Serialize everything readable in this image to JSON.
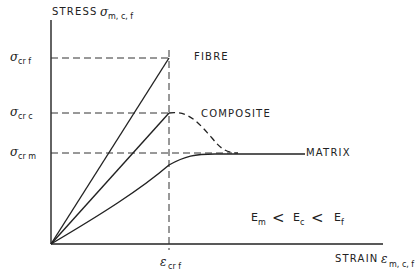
{
  "diagram": {
    "y_axis_label": "STRESS",
    "y_axis_symbol": "σ",
    "y_axis_subscript": "m, c, f",
    "x_axis_label": "STRAIN",
    "x_axis_symbol": "ε",
    "x_axis_subscript": "m, c, f",
    "y_ticks": [
      {
        "symbol": "σ",
        "subscript": "cr f"
      },
      {
        "symbol": "σ",
        "subscript": "cr c"
      },
      {
        "symbol": "σ",
        "subscript": "cr m"
      }
    ],
    "x_tick": {
      "symbol": "ε",
      "subscript": "cr f"
    },
    "curves": [
      {
        "name": "FIBRE",
        "style": "solid",
        "shape": "linear to failure"
      },
      {
        "name": "COMPOSITE",
        "style": "solid then dashed",
        "shape": "linear then peak then decline to matrix level"
      },
      {
        "name": "MATRIX",
        "style": "solid",
        "shape": "nonlinear rising to plateau"
      }
    ],
    "relation": {
      "e1": "E",
      "s1": "m",
      "op1": "<",
      "e2": "E",
      "s2": "c",
      "op2": "<",
      "e3": "E",
      "s3": "f"
    }
  }
}
